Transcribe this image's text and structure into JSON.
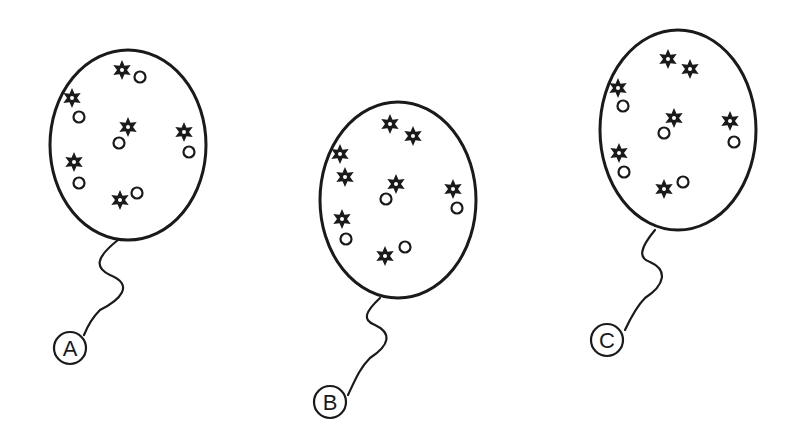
{
  "diagram": {
    "stroke_color": "#1a1a1a",
    "background": "#ffffff",
    "balloons": [
      {
        "label": "A",
        "ellipse": {
          "cx": 128,
          "cy": 145,
          "rx": 78,
          "ry": 95
        },
        "string": "M 118 240 C 95 258, 95 268, 110 275 C 135 285, 120 300, 100 310 C 92 318, 88 325, 84 335",
        "label_circle": {
          "cx": 70,
          "cy": 348,
          "r": 16
        },
        "stars": [
          [
            122,
            70
          ],
          [
            72,
            98
          ],
          [
            128,
            127
          ],
          [
            184,
            132
          ],
          [
            74,
            162
          ],
          [
            120,
            200
          ]
        ],
        "circles": [
          [
            140,
            77
          ],
          [
            79,
            117
          ],
          [
            119,
            143
          ],
          [
            189,
            152
          ],
          [
            79,
            183
          ],
          [
            137,
            193
          ]
        ]
      },
      {
        "label": "B",
        "ellipse": {
          "cx": 398,
          "cy": 200,
          "rx": 78,
          "ry": 98
        },
        "string": "M 380 298 C 365 312, 362 320, 375 325 C 392 333, 390 345, 370 358 C 360 368, 356 378, 348 395",
        "label_circle": {
          "cx": 330,
          "cy": 402,
          "r": 16
        },
        "stars": [
          [
            390,
            124
          ],
          [
            413,
            136
          ],
          [
            340,
            154
          ],
          [
            345,
            177
          ],
          [
            396,
            184
          ],
          [
            453,
            189
          ],
          [
            342,
            219
          ],
          [
            385,
            256
          ]
        ],
        "circles": [
          [
            386,
            199
          ],
          [
            457,
            208
          ],
          [
            346,
            239
          ],
          [
            405,
            247
          ]
        ]
      },
      {
        "label": "C",
        "ellipse": {
          "cx": 678,
          "cy": 130,
          "rx": 78,
          "ry": 100
        },
        "string": "M 655 230 C 640 248, 638 258, 650 262 C 668 270, 665 285, 645 298 C 638 305, 632 315, 625 330",
        "label_circle": {
          "cx": 607,
          "cy": 340,
          "r": 16
        },
        "stars": [
          [
            668,
            59
          ],
          [
            690,
            69
          ],
          [
            618,
            88
          ],
          [
            674,
            118
          ],
          [
            730,
            121
          ],
          [
            619,
            153
          ],
          [
            664,
            189
          ]
        ],
        "circles": [
          [
            623,
            106
          ],
          [
            664,
            133
          ],
          [
            734,
            142
          ],
          [
            624,
            172
          ],
          [
            683,
            182
          ]
        ]
      }
    ]
  }
}
